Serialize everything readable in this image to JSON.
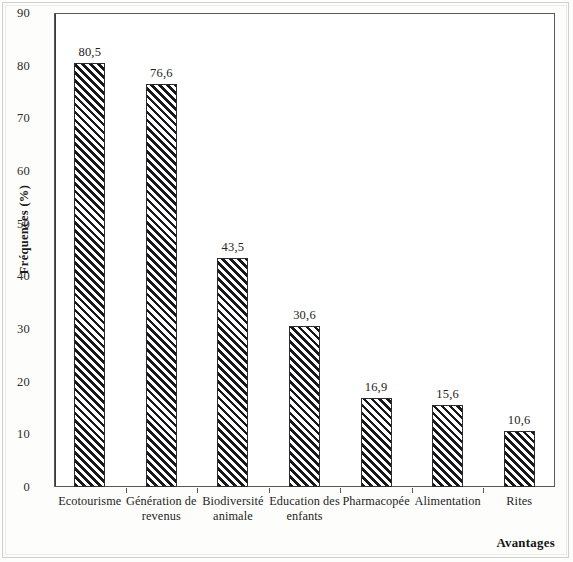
{
  "chart_data": {
    "type": "bar",
    "title": "",
    "subtitle": "",
    "xlabel": "Avantages",
    "ylabel": "Fréquences (%)",
    "categories": [
      "Ecotourisme",
      "Génération de revenus",
      "Biodiversité animale",
      "Education des enfants",
      "Pharmacopée",
      "Alimentation",
      "Rites"
    ],
    "category_lines": [
      [
        "Ecotourisme"
      ],
      [
        "Génération de",
        "revenus"
      ],
      [
        "Biodiversité",
        "animale"
      ],
      [
        "Education des",
        "enfants"
      ],
      [
        "Pharmacopée"
      ],
      [
        "Alimentation"
      ],
      [
        "Rites"
      ]
    ],
    "values": [
      80.5,
      76.6,
      43.5,
      30.6,
      16.9,
      15.6,
      10.6
    ],
    "value_labels": [
      "80,5",
      "76,6",
      "43,5",
      "30,6",
      "16,9",
      "15,6",
      "10,6"
    ],
    "ylim": [
      0,
      90
    ],
    "ytick_step": 10,
    "ytick_labels": [
      "0",
      "10",
      "20",
      "30",
      "40",
      "50",
      "60",
      "70",
      "80",
      "90"
    ],
    "grid": false,
    "legend": null,
    "bar_fill": "diagonal-hatch",
    "bar_color": "#18181a",
    "frame_color": "#59595c",
    "background": "#ffffff"
  }
}
